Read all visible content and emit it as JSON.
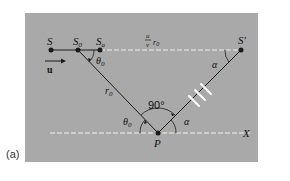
{
  "figure": {
    "panel_label": "(a)",
    "colors": {
      "panel_bg": "#a9a9a9",
      "line": "#1a1a1a",
      "dashed": "#f0f0f0",
      "hatch": "#ffffff"
    },
    "labels": {
      "S": "S",
      "S0": "S",
      "S0_sub": "0",
      "Sa": "S",
      "Sa_sub": "a",
      "S_prime": "S′",
      "u_vector": "u",
      "distance_num": "u",
      "distance_den": "v",
      "distance_r": "r",
      "distance_r_sub": "0",
      "theta0_top": "θ",
      "theta0_top_sub": "0",
      "r0": "r",
      "r0_sub": "0",
      "theta0_bottom": "θ",
      "theta0_bottom_sub": "0",
      "right_angle": "90°",
      "alpha_top": "α",
      "alpha_bottom": "α",
      "P": "P",
      "X": "X"
    }
  }
}
